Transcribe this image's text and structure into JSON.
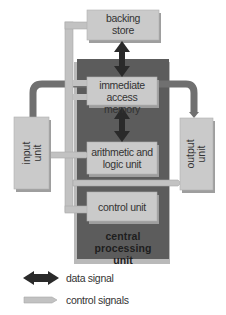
{
  "diagram": {
    "nodes": {
      "backing_store": {
        "line1": "backing",
        "line2": "store"
      },
      "immediate_access_memory": {
        "line1": "immediate access",
        "line2": "memory"
      },
      "alu": {
        "line1": "arithmetic and",
        "line2": "logic unit"
      },
      "control_unit": {
        "label": "control unit"
      },
      "cpu": {
        "line1": "central processing",
        "line2": "unit"
      },
      "input_unit": {
        "line1": "input",
        "line2": "unit"
      },
      "output_unit": {
        "line1": "output",
        "line2": "unit"
      }
    },
    "legend": {
      "data_signal": "data signal",
      "control_signals": "control signals"
    },
    "colors": {
      "box_fill": "#c8c8c8",
      "box_shadow": "#9a9a9a",
      "cpu_fill": "#5e5e5e",
      "cpu_shadow": "#b4b4b4",
      "control_path": "#bdbdbd",
      "data_path": "#6e6e6e",
      "data_arrow": "#2a2a2a"
    }
  }
}
